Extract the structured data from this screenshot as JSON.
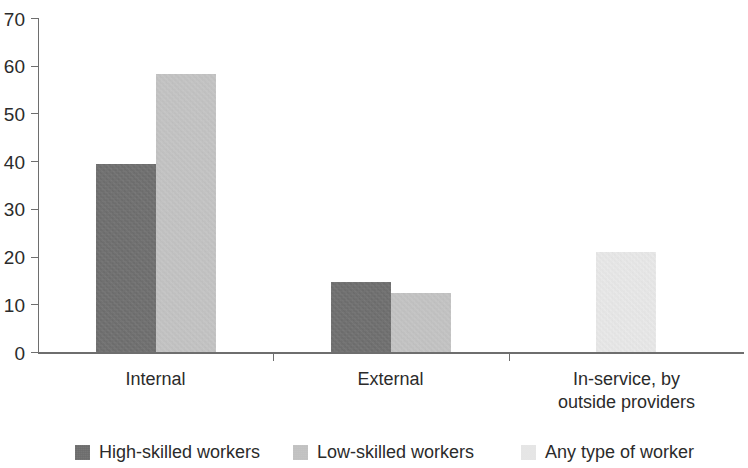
{
  "chart_data": {
    "type": "bar",
    "title": "",
    "subtitle": "",
    "xlabel": "",
    "ylabel": "",
    "ylim": [
      0,
      70
    ],
    "ytick_step": 10,
    "yticks": [
      "70",
      "60",
      "50",
      "40",
      "30",
      "20",
      "10",
      "0"
    ],
    "grid": false,
    "legend_position": "bottom",
    "categories": [
      "Internal",
      "External",
      "In-service, by outside providers"
    ],
    "category_labels_wrapped": [
      [
        "Internal"
      ],
      [
        "External"
      ],
      [
        "In-service, by",
        "outside providers"
      ]
    ],
    "series": [
      {
        "name": "High-skilled workers",
        "color": "#666666",
        "values": [
          39.5,
          14.6,
          null
        ]
      },
      {
        "name": "Low-skilled workers",
        "color": "#c6c6c6",
        "values": [
          58.2,
          12.4,
          null
        ]
      },
      {
        "name": "Any type of worker",
        "color": "#f0f0f0",
        "values": [
          null,
          null,
          21.0
        ]
      }
    ]
  },
  "legend": {
    "items": [
      {
        "label": "High-skilled workers",
        "color": "#666666"
      },
      {
        "label": "Low-skilled workers",
        "color": "#c6c6c6"
      },
      {
        "label": "Any type of worker",
        "color": "#f0f0f0"
      }
    ]
  },
  "axis": {
    "axis_color": "#6e6e6e",
    "text_color": "#2b2b2b"
  }
}
